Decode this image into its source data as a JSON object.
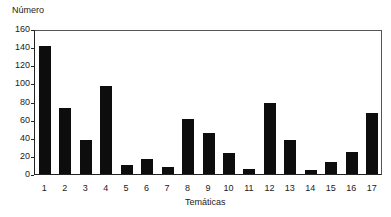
{
  "chart_data": {
    "type": "bar",
    "title": "",
    "ylabel": "Número",
    "xlabel": "Temáticas",
    "categories": [
      "1",
      "2",
      "3",
      "4",
      "5",
      "6",
      "7",
      "8",
      "9",
      "10",
      "11",
      "12",
      "13",
      "14",
      "15",
      "16",
      "17"
    ],
    "values": [
      143,
      74,
      38,
      99,
      10,
      17,
      8,
      61,
      46,
      23,
      6,
      80,
      38,
      4,
      13,
      25,
      68
    ],
    "ylim": [
      0,
      160
    ],
    "yticks": [
      "0",
      "20",
      "40",
      "60",
      "80",
      "100",
      "120",
      "140",
      "160"
    ],
    "grid": false,
    "bar_color": "#0d0d0d"
  }
}
